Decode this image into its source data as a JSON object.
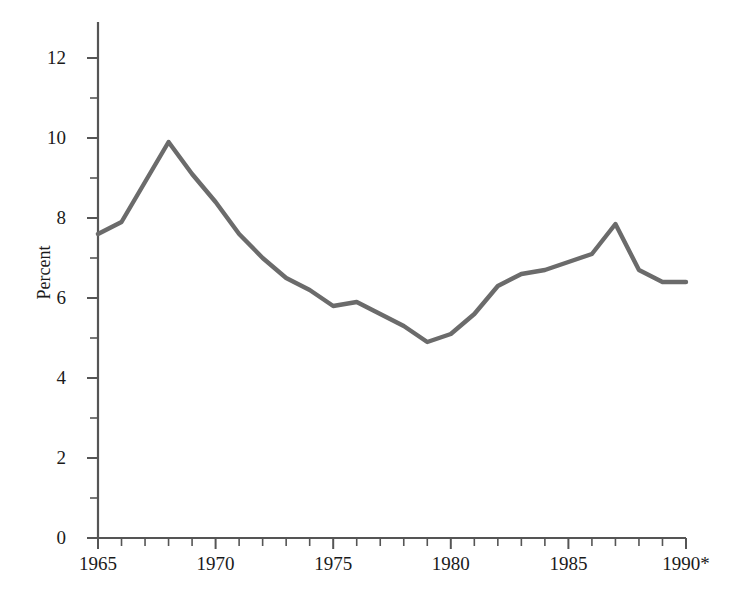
{
  "chart_data": {
    "type": "line",
    "title": "",
    "subtitle": "",
    "xlabel": "",
    "ylabel": "Percent",
    "x": [
      1965,
      1966,
      1967,
      1968,
      1969,
      1970,
      1971,
      1972,
      1973,
      1974,
      1975,
      1976,
      1977,
      1978,
      1979,
      1980,
      1981,
      1982,
      1983,
      1984,
      1985,
      1986,
      1987,
      1988,
      1989,
      1990
    ],
    "values": [
      7.6,
      7.9,
      8.9,
      9.9,
      9.1,
      8.4,
      7.6,
      7.0,
      6.5,
      6.2,
      5.8,
      5.9,
      5.6,
      5.3,
      4.9,
      5.1,
      5.6,
      6.3,
      6.6,
      6.7,
      6.9,
      7.1,
      7.85,
      6.7,
      6.4,
      6.4
    ],
    "series": [
      {
        "name": "Percent",
        "color": "#6b6b6b",
        "values": [
          7.6,
          7.9,
          8.9,
          9.9,
          9.1,
          8.4,
          7.6,
          7.0,
          6.5,
          6.2,
          5.8,
          5.9,
          5.6,
          5.3,
          4.9,
          5.1,
          5.6,
          6.3,
          6.6,
          6.7,
          6.9,
          7.1,
          7.85,
          6.7,
          6.4,
          6.4
        ]
      }
    ],
    "xlim": [
      1965,
      1990
    ],
    "ylim": [
      0,
      12.6
    ],
    "y_major_ticks": [
      0,
      2,
      4,
      6,
      8,
      10,
      12
    ],
    "y_major_tick_labels": [
      "0",
      "2",
      "4",
      "6",
      "8",
      "10",
      "12"
    ],
    "y_minor_ticks": [
      1,
      3,
      5,
      7,
      9,
      11
    ],
    "x_major_ticks": [
      1965,
      1970,
      1975,
      1980,
      1985,
      1990
    ],
    "x_major_tick_labels": [
      "1965",
      "1970",
      "1975",
      "1980",
      "1985",
      "1990*"
    ],
    "x_minor_ticks": [
      1966,
      1967,
      1968,
      1969,
      1971,
      1972,
      1973,
      1974,
      1976,
      1977,
      1978,
      1979,
      1981,
      1982,
      1983,
      1984,
      1986,
      1987,
      1988,
      1989
    ],
    "grid": false,
    "legend": false,
    "legend_position": "none",
    "annotations": [
      "1990*"
    ],
    "axis_color": "#555555",
    "line_color": "#6b6b6b",
    "background_color": "#ffffff"
  }
}
